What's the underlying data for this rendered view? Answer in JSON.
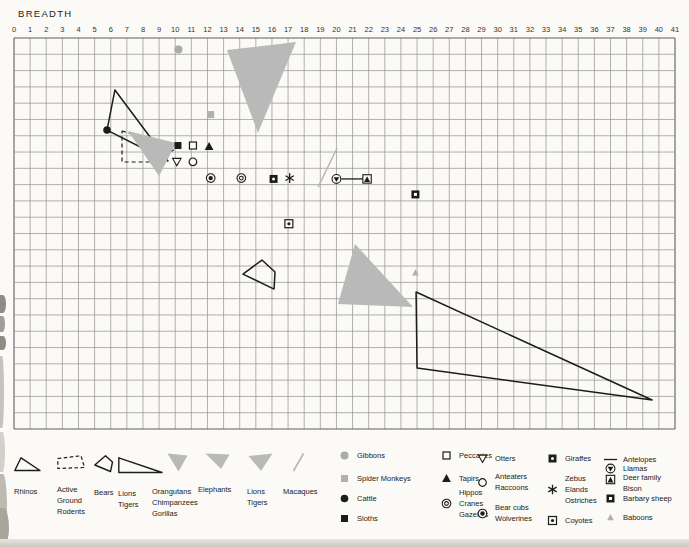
{
  "page": {
    "title": "BREADTH"
  },
  "colors": {
    "paper": "#fbfaf6",
    "ink": "#1c1c1c",
    "grid": "#979797",
    "grid_border": "#5f5f5f",
    "shape_gray": "#b9b9b9",
    "marker_gray": "#b0b0b0",
    "text": "#222222"
  },
  "chart_data": {
    "type": "scatter",
    "title": "BREADTH",
    "x_axis": {
      "label": "BREADTH",
      "min": 0,
      "max": 41,
      "ticks": [
        0,
        1,
        2,
        3,
        4,
        5,
        6,
        7,
        8,
        9,
        10,
        11,
        12,
        13,
        14,
        15,
        16,
        17,
        18,
        19,
        20,
        21,
        22,
        23,
        24,
        25,
        26,
        27,
        28,
        29,
        30,
        31,
        32,
        33,
        34,
        35,
        36,
        37,
        38,
        39,
        40,
        41
      ]
    },
    "y_axis": {
      "rows": 24,
      "partial_labels": [
        {
          "text": "2",
          "row": 21
        },
        {
          "text": "3",
          "row": 22
        },
        {
          "text": "4",
          "row": 23
        }
      ]
    },
    "grid": {
      "cols": 41,
      "rows": 24,
      "grid_on": true
    },
    "shapes": [
      {
        "name": "rhinos-outline-triangle",
        "kind": "polygon",
        "style": "outline",
        "points": [
          [
            6.26,
            3.19
          ],
          [
            5.77,
            5.65
          ],
          [
            9.55,
            7.55
          ]
        ]
      },
      {
        "name": "active-ground-rodents-dashed-shape",
        "kind": "polygon",
        "style": "dashed",
        "points": [
          [
            6.7,
            5.71
          ],
          [
            10.17,
            6.69
          ],
          [
            8.75,
            7.61
          ],
          [
            6.7,
            7.61
          ]
        ]
      },
      {
        "name": "orangutans-chimpanzees-gorillas-gray-triangle",
        "kind": "polygon",
        "style": "gray",
        "points": [
          [
            7.07,
            5.71
          ],
          [
            10.05,
            6.44
          ],
          [
            9.0,
            8.47
          ]
        ]
      },
      {
        "name": "elephants-gray-triangle",
        "kind": "polygon",
        "style": "gray",
        "points": [
          [
            13.21,
            0.74
          ],
          [
            17.49,
            0.25
          ],
          [
            15.13,
            5.83
          ]
        ]
      },
      {
        "name": "bears-outline-shape",
        "kind": "polygon",
        "style": "outline",
        "points": [
          [
            14.2,
            14.49
          ],
          [
            15.38,
            13.63
          ],
          [
            16.19,
            14.36
          ],
          [
            16.13,
            15.41
          ]
        ]
      },
      {
        "name": "lions-tigers-gray-triangle",
        "kind": "polygon",
        "style": "gray",
        "points": [
          [
            21.15,
            12.65
          ],
          [
            20.1,
            16.33
          ],
          [
            24.75,
            16.51
          ]
        ]
      },
      {
        "name": "lions-tigers-outline-triangle",
        "kind": "polygon",
        "style": "outline",
        "points": [
          [
            24.94,
            15.59
          ],
          [
            25.0,
            20.26
          ],
          [
            39.58,
            22.22
          ]
        ]
      },
      {
        "name": "macaques-gray-line",
        "kind": "line",
        "style": "grayline",
        "points": [
          [
            18.86,
            9.15
          ],
          [
            20.04,
            6.75
          ]
        ]
      },
      {
        "name": "antelopes-line",
        "kind": "line",
        "style": "inkline",
        "points": [
          [
            20.3,
            8.65
          ],
          [
            21.65,
            8.65
          ]
        ]
      }
    ],
    "markers": [
      {
        "name": "Gibbons",
        "type": "gray-circle",
        "x": 10.2,
        "y": 0.7
      },
      {
        "name": "Spider Monkeys",
        "type": "gray-square",
        "x": 12.2,
        "y": 4.7
      },
      {
        "name": "Cattle",
        "type": "filled-circle",
        "x": 5.77,
        "y": 5.65
      },
      {
        "name": "Sloths",
        "type": "filled-square",
        "x": 10.17,
        "y": 6.6
      },
      {
        "name": "Peccaries",
        "type": "open-square",
        "x": 11.1,
        "y": 6.6
      },
      {
        "name": "Tapirs",
        "type": "filled-triangle",
        "x": 12.1,
        "y": 6.65
      },
      {
        "name": "Otters",
        "type": "open-inv-triangle",
        "x": 10.1,
        "y": 7.6
      },
      {
        "name": "Anteaters Raccoons",
        "type": "open-circle",
        "x": 11.1,
        "y": 7.6
      },
      {
        "name": "Bear cubs Wolverines",
        "type": "bullseye",
        "x": 12.2,
        "y": 8.6
      },
      {
        "name": "Hippos Cranes Gazelles",
        "type": "double-circle",
        "x": 14.1,
        "y": 8.6
      },
      {
        "name": "Giraffes",
        "type": "square-white-dot",
        "x": 16.1,
        "y": 8.65
      },
      {
        "name": "Zebus Elands Ostriches",
        "type": "asterisk",
        "x": 17.1,
        "y": 8.6
      },
      {
        "name": "Llamas",
        "type": "circle-triangle",
        "x": 20.0,
        "y": 8.65
      },
      {
        "name": "Deer family Bison",
        "type": "square-triangle",
        "x": 21.9,
        "y": 8.65
      },
      {
        "name": "Barbary sheep",
        "type": "filled-square-white-square",
        "x": 24.9,
        "y": 9.6
      },
      {
        "name": "Coyotes",
        "type": "square-dot",
        "x": 17.05,
        "y": 11.4
      },
      {
        "name": "Baboons",
        "type": "gray-triangle-small",
        "x": 24.9,
        "y": 14.4
      }
    ]
  },
  "legend": {
    "shapes": [
      {
        "label": "Rhinos"
      },
      {
        "label": "Active\nGround\nRodents"
      },
      {
        "label": "Bears"
      },
      {
        "label": "Lions\nTigers"
      },
      {
        "label": "Orangutans\nChimpanzees\nGorillas"
      },
      {
        "label": "Elephants"
      },
      {
        "label": "Lions\nTigers"
      },
      {
        "label": "Macaques"
      }
    ],
    "markers": [
      {
        "label": "Gibbons",
        "type": "gray-circle"
      },
      {
        "label": "Spider Monkeys",
        "type": "gray-square"
      },
      {
        "label": "Cattle",
        "type": "filled-circle"
      },
      {
        "label": "Sloths",
        "type": "filled-square"
      },
      {
        "label": "Peccaries",
        "type": "open-square"
      },
      {
        "label": "Tapirs",
        "type": "filled-triangle"
      },
      {
        "label": "Hippos\nCranes\nGazelles",
        "type": "double-circle"
      },
      {
        "label": "Otters",
        "type": "open-inv-triangle"
      },
      {
        "label": "Anteaters\nRaccoons",
        "type": "open-circle"
      },
      {
        "label": "Bear cubs\nWolverines",
        "type": "bullseye"
      },
      {
        "label": "Giraffes",
        "type": "square-white-dot"
      },
      {
        "label": "Zebus\nElands\nOstriches",
        "type": "asterisk"
      },
      {
        "label": "Coyotes",
        "type": "square-dot"
      },
      {
        "label": "Antelopes",
        "type": "line"
      },
      {
        "label": "Llamas",
        "type": "circle-triangle"
      },
      {
        "label": "Deer family\nBison",
        "type": "square-triangle"
      },
      {
        "label": "Barbary sheep",
        "type": "filled-square-white-square"
      },
      {
        "label": "Baboons",
        "type": "gray-triangle-small"
      }
    ]
  }
}
